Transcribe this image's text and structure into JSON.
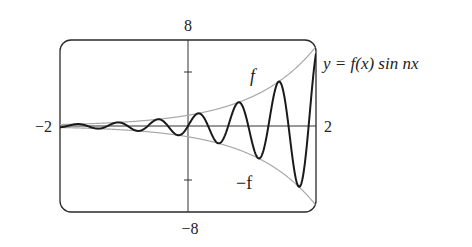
{
  "chart_data": {
    "type": "line",
    "title": "",
    "equation_label": "y = f(x) sin nx",
    "xlabel": "",
    "ylabel": "",
    "xlim": [
      -2,
      2
    ],
    "ylim": [
      -8,
      8
    ],
    "axis_labels": {
      "x_min": "−2",
      "x_max": "2",
      "y_max": "8",
      "y_min": "−8"
    },
    "y_ticks": [
      -5,
      5
    ],
    "grid": false,
    "series": [
      {
        "name": "y = f(x) sin nx",
        "formula": "exp(x) * sin(10x)",
        "n": 10,
        "color": "#1a1a1a",
        "style": "solid-thick"
      },
      {
        "name": "f",
        "label": "f",
        "formula": "exp(x)",
        "color": "#a8a8a8",
        "style": "solid-thin"
      },
      {
        "name": "-f",
        "label": "−f",
        "formula": "-exp(x)",
        "color": "#a8a8a8",
        "style": "solid-thin"
      }
    ],
    "sample_points": {
      "x": [
        -2,
        -1.5,
        -1,
        -0.5,
        0,
        0.157,
        0.785,
        1.414,
        1.728,
        2
      ],
      "y_curve": [
        0.12,
        -0.14,
        0.2,
        0.58,
        0,
        1.17,
        2.19,
        4.11,
        -5.63,
        6.71
      ],
      "y_envelope": [
        0.14,
        0.22,
        0.37,
        0.61,
        1,
        1.17,
        2.19,
        4.11,
        5.63,
        7.39
      ]
    }
  },
  "labels": {
    "equation": "y = f(x) sin nx",
    "f": "f",
    "neg_f": "−f",
    "x_min": "−2",
    "x_max": "2",
    "y_max": "8",
    "y_min": "−8"
  }
}
